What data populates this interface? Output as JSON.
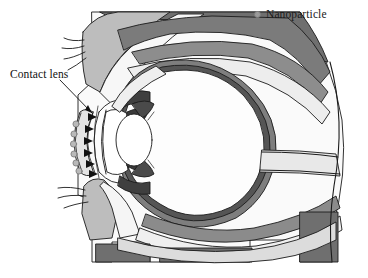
{
  "figure": {
    "background_color": "#ffffff",
    "width": 368,
    "height": 278
  },
  "legend": {
    "marker_icon": "nanoparticle-dot-icon",
    "marker_color": "#9a9a9a",
    "label": "Nanoparticle"
  },
  "callouts": [
    {
      "id": "contact-lens",
      "label": "Contact lens",
      "leader_from": {
        "x": 62,
        "y": 80
      },
      "leader_to": {
        "x": 93,
        "y": 114
      }
    }
  ],
  "palette": {
    "outline": "#1b1b1b",
    "sclera_white": "#fbfbfb",
    "light_gray": "#d8d8d8",
    "mid_gray": "#b4b4b4",
    "dark_gray": "#7f7f7f",
    "darkest_gray": "#5a5a5a",
    "nanoparticle": "#9a9a9a",
    "arrow": "#111111"
  },
  "structures": [
    {
      "name": "upper-eyelid",
      "shade": "mid_gray"
    },
    {
      "name": "lower-eyelid",
      "shade": "mid_gray"
    },
    {
      "name": "eyelashes-upper",
      "count": 4
    },
    {
      "name": "eyelashes-lower",
      "count": 3
    },
    {
      "name": "cornea",
      "shade": "sclera_white"
    },
    {
      "name": "anterior-chamber",
      "shade": "sclera_white"
    },
    {
      "name": "iris",
      "shade": "darkest_gray"
    },
    {
      "name": "crystalline-lens",
      "shade": "sclera_white"
    },
    {
      "name": "vitreous-body",
      "shade": "sclera_white"
    },
    {
      "name": "retina-choroid-sclera",
      "shade": "dark_gray"
    },
    {
      "name": "optic-nerve",
      "shade": "light_gray"
    },
    {
      "name": "extraocular-muscle-superior",
      "shade": "dark_gray"
    },
    {
      "name": "extraocular-muscle-inferior",
      "shade": "dark_gray"
    },
    {
      "name": "orbital-bone",
      "shade": "darkest_gray"
    },
    {
      "name": "orbital-fat",
      "shade": "light_gray"
    }
  ],
  "contact_lens": {
    "name": "contact-lens",
    "nanoparticle_count": 6,
    "arrow_count": 6,
    "arrow_direction": "toward-cornea-right",
    "fill": "#e2e2e2"
  }
}
